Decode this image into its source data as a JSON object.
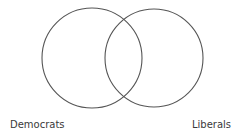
{
  "diagram": {
    "type": "venn",
    "stroke_color": "#555555",
    "sets": [
      {
        "label": "Democrats",
        "cx": 92,
        "cy": 58,
        "r": 50
      },
      {
        "label": "Liberals",
        "cx": 154,
        "cy": 58,
        "r": 49
      }
    ]
  }
}
